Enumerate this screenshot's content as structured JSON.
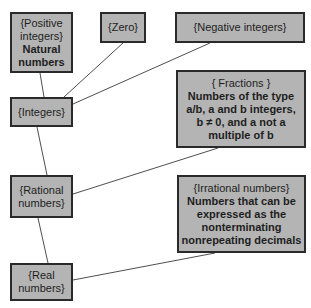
{
  "nodes": {
    "positive": {
      "line1": "{Positive",
      "line2": "integers}",
      "line3": "Natural",
      "line4": "numbers"
    },
    "zero": {
      "title": "{Zero}"
    },
    "negative": {
      "title": "{Negative integers}"
    },
    "integers": {
      "title": "{Integers}"
    },
    "fractions": {
      "title": "{ Fractions }",
      "desc1": "Numbers of the type",
      "desc2": "a/b, a and b integers,",
      "desc3": "b ≠ 0, and a not a",
      "desc4": "multiple of b"
    },
    "rational": {
      "line1": "{Rational",
      "line2": "numbers}"
    },
    "irrational": {
      "title": "{Irrational numbers}",
      "desc1": "Numbers that can be",
      "desc2": "expressed as the",
      "desc3": "nonterminating",
      "desc4": "nonrepeating decimals"
    },
    "real": {
      "line1": "{Real",
      "line2": "numbers}"
    }
  },
  "colors": {
    "box_fill": "#b4b4b4",
    "border": "#2a2a2a",
    "line": "#3a3a3a"
  }
}
